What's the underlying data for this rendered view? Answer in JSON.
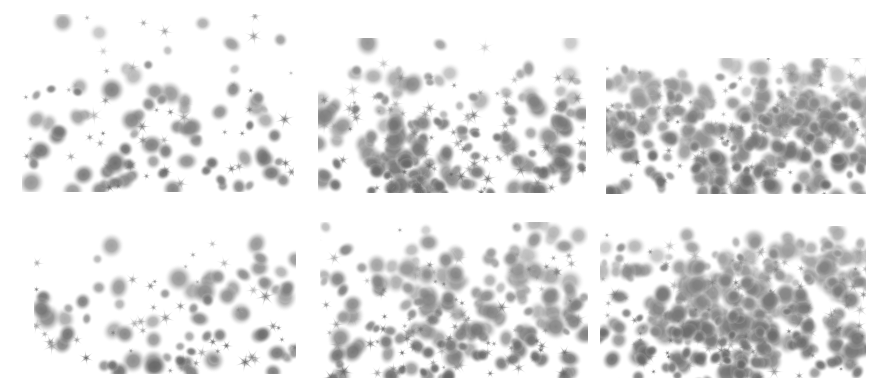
{
  "figure": {
    "caption": "",
    "background_color": "#ffffff",
    "width": 889,
    "height": 386,
    "rows": 2,
    "columns": 3,
    "has_axes": false,
    "has_gridlines": false,
    "has_tick_labels": false,
    "has_legend": false,
    "has_border": false
  },
  "object_styles": {
    "galaxy": {
      "name": "galaxy-blob",
      "shape": "soft-ellipse",
      "color_dark": "#6f6f6f",
      "color_mid": "#9a9a9a",
      "color_light": "#c8c8c8",
      "color_faint": "#e2e2e2"
    },
    "star": {
      "name": "star-diffraction-spike",
      "shape": "six-point-spike",
      "color_dark": "#7a7a7a",
      "color_mid": "#a5a5a5",
      "color_light": "#cfcfcf"
    }
  },
  "chart_data": {
    "type": "scatter",
    "subtitle": "",
    "xlabel": "",
    "ylabel": "",
    "xlim": [
      0,
      1
    ],
    "ylim": [
      0,
      1
    ],
    "grid": false,
    "legend": false,
    "legend_position": "none",
    "panel_layout": {
      "rows": 2,
      "cols": 3
    },
    "annotations": [],
    "panels": [
      {
        "index": 0,
        "row": 0,
        "col": 0,
        "name": "panel-top-left",
        "density_label": "low",
        "galaxy_count": 78,
        "star_count": 46,
        "seed": 11,
        "x": 22,
        "y": 14,
        "width": 272,
        "height": 178,
        "clustering": 0.1,
        "mean_galaxy_radius": 5.4,
        "mean_star_size": 9.0,
        "edge_fade_top": 0.38,
        "edge_fade_left": 0.16
      },
      {
        "index": 1,
        "row": 0,
        "col": 1,
        "name": "panel-top-center",
        "density_label": "medium",
        "galaxy_count": 168,
        "star_count": 92,
        "seed": 27,
        "x": 318,
        "y": 38,
        "width": 268,
        "height": 155,
        "clustering": 0.3,
        "mean_galaxy_radius": 5.2,
        "mean_star_size": 8.6,
        "edge_fade_top": 0.22,
        "edge_fade_left": 0.2
      },
      {
        "index": 2,
        "row": 0,
        "col": 2,
        "name": "panel-top-right",
        "density_label": "high",
        "galaxy_count": 360,
        "star_count": 150,
        "seed": 43,
        "x": 606,
        "y": 58,
        "width": 260,
        "height": 136,
        "clustering": 0.58,
        "mean_galaxy_radius": 5.0,
        "mean_star_size": 8.2,
        "edge_fade_top": 0.14,
        "edge_fade_left": 0.26
      },
      {
        "index": 3,
        "row": 1,
        "col": 0,
        "name": "panel-bottom-left",
        "density_label": "low",
        "galaxy_count": 72,
        "star_count": 42,
        "seed": 59,
        "x": 34,
        "y": 226,
        "width": 262,
        "height": 148,
        "clustering": 0.1,
        "mean_galaxy_radius": 5.6,
        "mean_star_size": 9.2,
        "edge_fade_top": 0.3,
        "edge_fade_left": 0.18
      },
      {
        "index": 4,
        "row": 1,
        "col": 1,
        "name": "panel-bottom-center",
        "density_label": "medium",
        "galaxy_count": 176,
        "star_count": 96,
        "seed": 71,
        "x": 320,
        "y": 222,
        "width": 268,
        "height": 156,
        "clustering": 0.32,
        "mean_galaxy_radius": 5.3,
        "mean_star_size": 8.6,
        "edge_fade_top": 0.2,
        "edge_fade_left": 0.2
      },
      {
        "index": 5,
        "row": 1,
        "col": 2,
        "name": "panel-bottom-right",
        "density_label": "high",
        "galaxy_count": 380,
        "star_count": 158,
        "seed": 89,
        "x": 600,
        "y": 226,
        "width": 266,
        "height": 152,
        "clustering": 0.6,
        "mean_galaxy_radius": 5.1,
        "mean_star_size": 8.2,
        "edge_fade_top": 0.12,
        "edge_fade_left": 0.24
      }
    ]
  }
}
